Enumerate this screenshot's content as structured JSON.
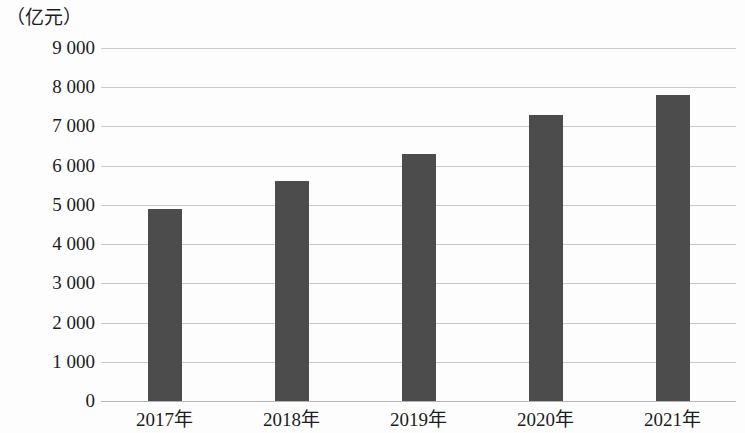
{
  "chart_data": {
    "type": "bar",
    "title": "",
    "subtitle": "",
    "xlabel": "",
    "ylabel": "（亿元）",
    "unit_label": "（亿元）",
    "categories": [
      "2017年",
      "2018年",
      "2019年",
      "2020年",
      "2021年"
    ],
    "values": [
      4900,
      5600,
      6300,
      7300,
      7800
    ],
    "ylim": [
      0,
      9000
    ],
    "ytick_step": 1000,
    "ytick_labels": [
      "9 000",
      "8 000",
      "7 000",
      "6 000",
      "5 000",
      "4 000",
      "3 000",
      "2 000",
      "1 000",
      "0"
    ],
    "ytick_values": [
      9000,
      8000,
      7000,
      6000,
      5000,
      4000,
      3000,
      2000,
      1000,
      0
    ],
    "grid": true,
    "legend": false,
    "legend_position": "none",
    "bar_color": "#4c4c4c",
    "gridline_color": "#c9c9c9",
    "axis_color": "#b4b4b4",
    "annotations": []
  }
}
